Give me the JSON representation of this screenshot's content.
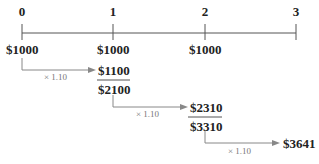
{
  "timeline": {
    "periods": [
      "0",
      "1",
      "2",
      "3"
    ],
    "deposits": [
      "$1000",
      "$1000",
      "$1000"
    ]
  },
  "steps": [
    {
      "multiplier": "× 1.10",
      "result": "$1100",
      "sum": "$2100"
    },
    {
      "multiplier": "× 1.10",
      "result": "$2310",
      "sum": "$3310"
    },
    {
      "multiplier": "× 1.10",
      "result": "$3641"
    }
  ],
  "colors": {
    "line": "#555555",
    "arrow": "#888888",
    "text": "#222222",
    "mult": "#777777"
  }
}
